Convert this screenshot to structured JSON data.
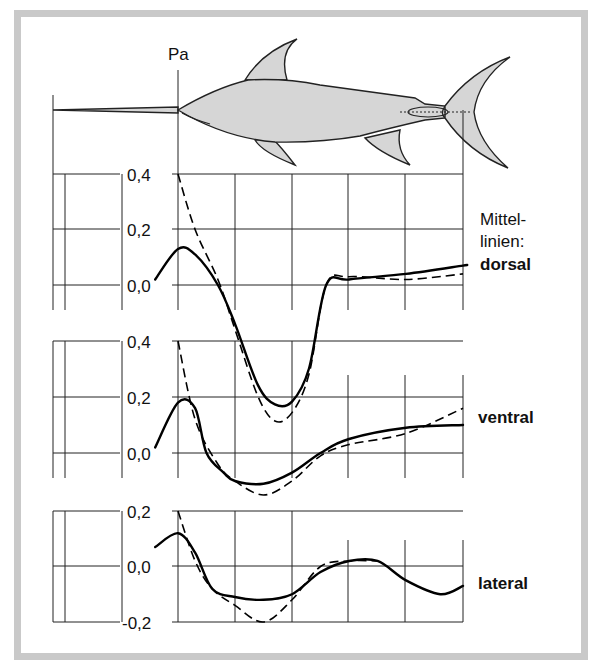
{
  "chart_data": [
    {
      "type": "line",
      "name": "dorsal",
      "title": "Mittellinien: dorsal",
      "ylabel": "Pa",
      "yticks": [
        "0,4",
        "0,2",
        "0,0"
      ],
      "ylim": [
        0.0,
        0.4
      ],
      "x_grid_positions": [
        0,
        1,
        2,
        3,
        4,
        5,
        6
      ],
      "series": [
        {
          "name": "measured (solid)",
          "style": "solid",
          "x": [
            -0.4,
            0.0,
            0.3,
            0.7,
            1.0,
            1.4,
            1.7,
            2.0,
            2.3,
            2.6,
            3.0,
            4.0,
            5.0,
            5.0
          ],
          "values": [
            0.02,
            0.13,
            0.11,
            0.0,
            -0.14,
            -0.36,
            -0.43,
            -0.42,
            -0.3,
            0.0,
            0.02,
            0.04,
            0.07,
            0.07
          ]
        },
        {
          "name": "computed (dashed)",
          "style": "dashed",
          "x": [
            0.0,
            0.3,
            0.7,
            1.0,
            1.4,
            1.7,
            2.0,
            2.3,
            2.6,
            3.0,
            4.0,
            5.0
          ],
          "values": [
            0.4,
            0.2,
            0.02,
            -0.16,
            -0.4,
            -0.49,
            -0.46,
            -0.32,
            0.0,
            0.03,
            0.02,
            0.04
          ]
        }
      ]
    },
    {
      "type": "line",
      "name": "ventral",
      "title": "ventral",
      "yticks": [
        "0,4",
        "0,2",
        "0,0"
      ],
      "ylim": [
        0.0,
        0.4
      ],
      "series": [
        {
          "name": "measured (solid)",
          "style": "solid",
          "x": [
            -0.4,
            0.0,
            0.3,
            0.5,
            0.8,
            1.0,
            1.5,
            2.0,
            2.5,
            3.0,
            4.0,
            5.0
          ],
          "values": [
            0.02,
            0.18,
            0.16,
            0.0,
            -0.07,
            -0.1,
            -0.11,
            -0.07,
            0.0,
            0.05,
            0.09,
            0.1
          ]
        },
        {
          "name": "computed (dashed)",
          "style": "dashed",
          "x": [
            0.0,
            0.3,
            0.7,
            1.0,
            1.5,
            2.0,
            2.5,
            3.0,
            4.0,
            5.0
          ],
          "values": [
            0.4,
            0.12,
            -0.04,
            -0.1,
            -0.15,
            -0.1,
            -0.01,
            0.03,
            0.07,
            0.16
          ]
        }
      ]
    },
    {
      "type": "line",
      "name": "lateral",
      "title": "lateral",
      "yticks": [
        "0,2",
        "0,0",
        "-0,2"
      ],
      "ylim": [
        -0.2,
        0.2
      ],
      "series": [
        {
          "name": "measured (solid)",
          "style": "solid",
          "x": [
            -0.4,
            0.0,
            0.3,
            0.6,
            1.0,
            1.5,
            2.0,
            2.5,
            3.0,
            3.5,
            4.0,
            4.6,
            5.0
          ],
          "values": [
            0.07,
            0.12,
            0.05,
            -0.08,
            -0.11,
            -0.12,
            -0.1,
            -0.02,
            0.02,
            0.02,
            -0.05,
            -0.1,
            -0.07
          ]
        },
        {
          "name": "computed (dashed)",
          "style": "dashed",
          "x": [
            0.0,
            0.3,
            0.6,
            1.0,
            1.5,
            2.0,
            2.5,
            3.0,
            3.5
          ],
          "values": [
            0.2,
            0.02,
            -0.08,
            -0.14,
            -0.2,
            -0.12,
            0.0,
            0.02,
            0.02
          ]
        }
      ]
    }
  ],
  "labels": {
    "unit": "Pa",
    "legend_heading_1": "Mittel-",
    "legend_heading_2": "linien:",
    "dorsal": "dorsal",
    "ventral": "ventral",
    "lateral": "lateral",
    "dorsal_ticks": [
      "0,4",
      "0,2",
      "0,0"
    ],
    "ventral_ticks": [
      "0,4",
      "0,2",
      "0,0"
    ],
    "lateral_ticks": [
      "0,2",
      "0,0",
      "-0,2"
    ]
  },
  "colors": {
    "frame": "#c9c9c9",
    "fish_fill": "#d6d6d6",
    "line": "#000000"
  }
}
